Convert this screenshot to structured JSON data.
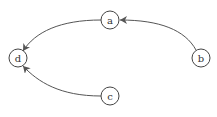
{
  "diagram": {
    "type": "directed-graph",
    "nodes": [
      {
        "id": "a",
        "label": "a",
        "x": 110,
        "y": 20
      },
      {
        "id": "b",
        "label": "b",
        "x": 201,
        "y": 58
      },
      {
        "id": "c",
        "label": "c",
        "x": 110,
        "y": 96
      },
      {
        "id": "d",
        "label": "d",
        "x": 18,
        "y": 58
      }
    ],
    "edges": [
      {
        "from": "b",
        "to": "a"
      },
      {
        "from": "a",
        "to": "d"
      },
      {
        "from": "c",
        "to": "d"
      }
    ]
  }
}
